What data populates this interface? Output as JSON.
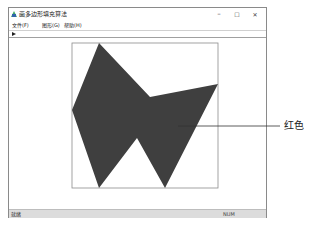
{
  "window": {
    "title": "画多边形填充算法",
    "controls": {
      "minimize": "–",
      "maximize": "☐",
      "close": "✕"
    }
  },
  "menubar": {
    "items": [
      {
        "label": "文件(F)"
      },
      {
        "label": "图形(G)"
      },
      {
        "label": "帮助(H)"
      }
    ]
  },
  "toolbar": {
    "icon": "arrow-icon"
  },
  "canvas": {
    "bounding_rect": {
      "x": 72,
      "y": 43,
      "width": 146,
      "height": 145,
      "stroke": "#8c8c8c"
    },
    "polygon": {
      "fill": "#3f3f3f",
      "points": "99,43 150,97 218,84 165,188 137,138 99,188 72,110"
    }
  },
  "statusbar": {
    "left": "就绪",
    "right": "NUM"
  },
  "annotation": {
    "label": "红色",
    "line_color": "#333333"
  }
}
